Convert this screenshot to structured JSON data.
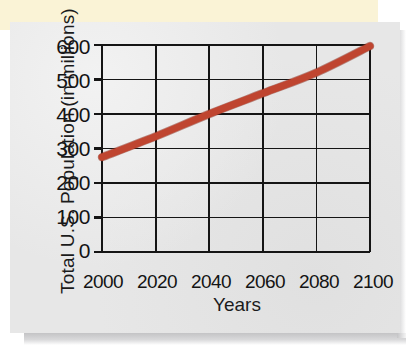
{
  "figure": {
    "card_label": "us-population-projection-figure",
    "paper_background": "#faf3d6",
    "card_background": "#e7e7e7"
  },
  "chart_data": {
    "type": "line",
    "title": "",
    "xlabel": "Years",
    "ylabel": "Total U.S. Population (in millions)",
    "x": [
      2000,
      2020,
      2040,
      2060,
      2080,
      2100
    ],
    "xticklabels": [
      "2000",
      "2020",
      "2040",
      "2060",
      "2080",
      "2100"
    ],
    "yticklabels": [
      "0",
      "100",
      "200",
      "300",
      "400",
      "500",
      "600"
    ],
    "yticks": [
      0,
      100,
      200,
      300,
      400,
      500,
      600
    ],
    "xlim": [
      2000,
      2100
    ],
    "ylim": [
      0,
      600
    ],
    "grid": true,
    "legend": "none",
    "series": [
      {
        "name": "Total U.S. Population",
        "color": "#bf4530",
        "linewidth": 7,
        "values": [
          275,
          335,
          400,
          460,
          520,
          597
        ]
      }
    ]
  }
}
